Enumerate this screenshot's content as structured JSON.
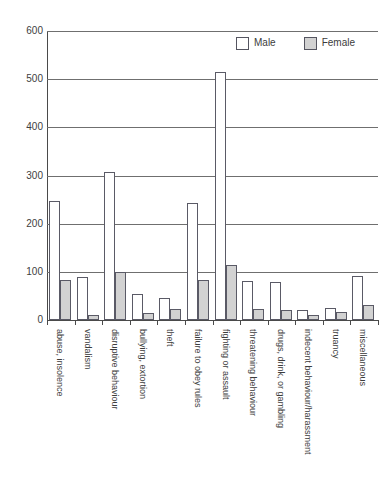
{
  "chart_data": {
    "type": "bar",
    "title": "",
    "xlabel": "",
    "ylabel": "",
    "ylim": [
      0,
      600
    ],
    "ytick_step": 100,
    "yticks": [
      0,
      100,
      200,
      300,
      400,
      500,
      600
    ],
    "grid": true,
    "legend_position": "top-right",
    "categories": [
      "abuse, insolence",
      "vandalism",
      "disruptive behaviour",
      "bullying, extortion",
      "theft",
      "failure to obey rules",
      "fighting or assault",
      "threatening behaviour",
      "drugs, drink, or gambling",
      "indecent behaviour/harassment",
      "truancy",
      "miscellaneous"
    ],
    "series": [
      {
        "name": "Male",
        "color": "#ffffff",
        "values": [
          248,
          90,
          307,
          55,
          45,
          242,
          515,
          82,
          78,
          20,
          25,
          92
        ]
      },
      {
        "name": "Female",
        "color": "#d2d2d2",
        "values": [
          83,
          10,
          100,
          14,
          22,
          83,
          115,
          22,
          20,
          10,
          17,
          32
        ]
      }
    ]
  },
  "legend": {
    "items": [
      {
        "label": "Male",
        "swatch": "male"
      },
      {
        "label": "Female",
        "swatch": "female"
      }
    ]
  }
}
